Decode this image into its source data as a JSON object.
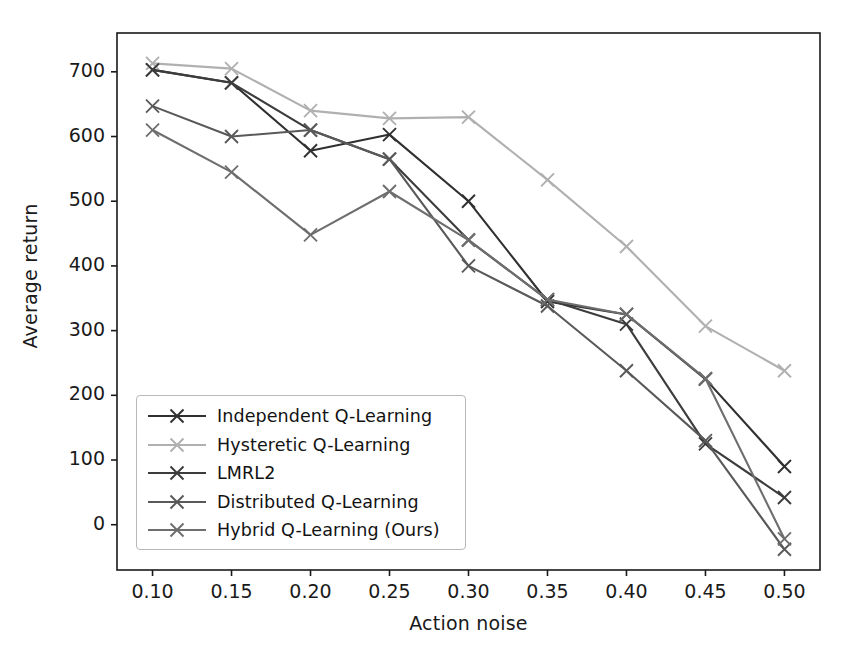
{
  "chart_data": {
    "type": "line",
    "title": "",
    "xlabel": "Action noise",
    "ylabel": "Average return",
    "x": [
      0.1,
      0.15,
      0.2,
      0.25,
      0.3,
      0.35,
      0.4,
      0.45,
      0.5
    ],
    "xtick_labels": [
      "0.10",
      "0.15",
      "0.20",
      "0.25",
      "0.30",
      "0.35",
      "0.40",
      "0.45",
      "0.50"
    ],
    "ytick_labels": [
      "0",
      "100",
      "200",
      "300",
      "400",
      "500",
      "600",
      "700"
    ],
    "ytick_values": [
      0,
      100,
      200,
      300,
      400,
      500,
      600,
      700
    ],
    "xlim": [
      0.0775,
      0.5225
    ],
    "ylim": [
      -70,
      760
    ],
    "grid": false,
    "legend_position": "lower left",
    "marker": "x",
    "series": [
      {
        "name": "Independent Q-Learning",
        "color": "#303030",
        "values": [
          703,
          683,
          578,
          603,
          500,
          345,
          325,
          225,
          90
        ]
      },
      {
        "name": "Hysteretic Q-Learning",
        "color": "#b0b0b0",
        "values": [
          713,
          705,
          640,
          628,
          630,
          533,
          430,
          307,
          238
        ]
      },
      {
        "name": "LMRL2",
        "color": "#3c3c3c",
        "values": [
          703,
          683,
          610,
          565,
          440,
          348,
          310,
          125,
          42
        ]
      },
      {
        "name": "Distributed Q-Learning",
        "color": "#595959",
        "values": [
          647,
          600,
          610,
          565,
          400,
          338,
          238,
          130,
          -38
        ]
      },
      {
        "name": "Hybrid Q-Learning (Ours)",
        "color": "#6e6e6e",
        "values": [
          610,
          545,
          448,
          515,
          440,
          348,
          325,
          226,
          -22
        ]
      }
    ]
  },
  "axes": {
    "spine_color": "#1a1a1a",
    "background": "#ffffff"
  }
}
